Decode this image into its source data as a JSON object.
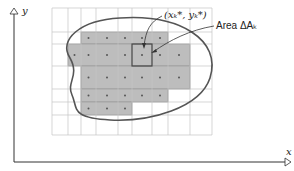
{
  "diagram": {
    "axes": {
      "x_label": "x",
      "y_label": "y"
    },
    "labels": {
      "point": "(xₖ*, yₖ*)",
      "area": "Area ΔAₖ"
    },
    "grid": {
      "columns_x": [
        52,
        68,
        81,
        96,
        118,
        132,
        152,
        168,
        190,
        212
      ],
      "rows_y": [
        8,
        32,
        44,
        66,
        89,
        102,
        115,
        135
      ]
    },
    "shaded_rows": [
      {
        "y0": 32,
        "y1": 44,
        "cols": [
          [
            81,
            168
          ]
        ]
      },
      {
        "y0": 44,
        "y1": 66,
        "cols": [
          [
            68,
            190
          ]
        ]
      },
      {
        "y0": 66,
        "y1": 89,
        "cols": [
          [
            81,
            190
          ]
        ]
      },
      {
        "y0": 89,
        "y1": 102,
        "cols": [
          [
            81,
            168
          ]
        ]
      },
      {
        "y0": 102,
        "y1": 115,
        "cols": [
          [
            81,
            132
          ]
        ]
      }
    ],
    "highlight_cell": {
      "x0": 132,
      "y0": 44,
      "x1": 152,
      "y1": 66
    },
    "colors": {
      "shade": "#bdbdbd",
      "grid": "#c4c4c4",
      "curve": "#555555",
      "axis": "#333333"
    }
  }
}
